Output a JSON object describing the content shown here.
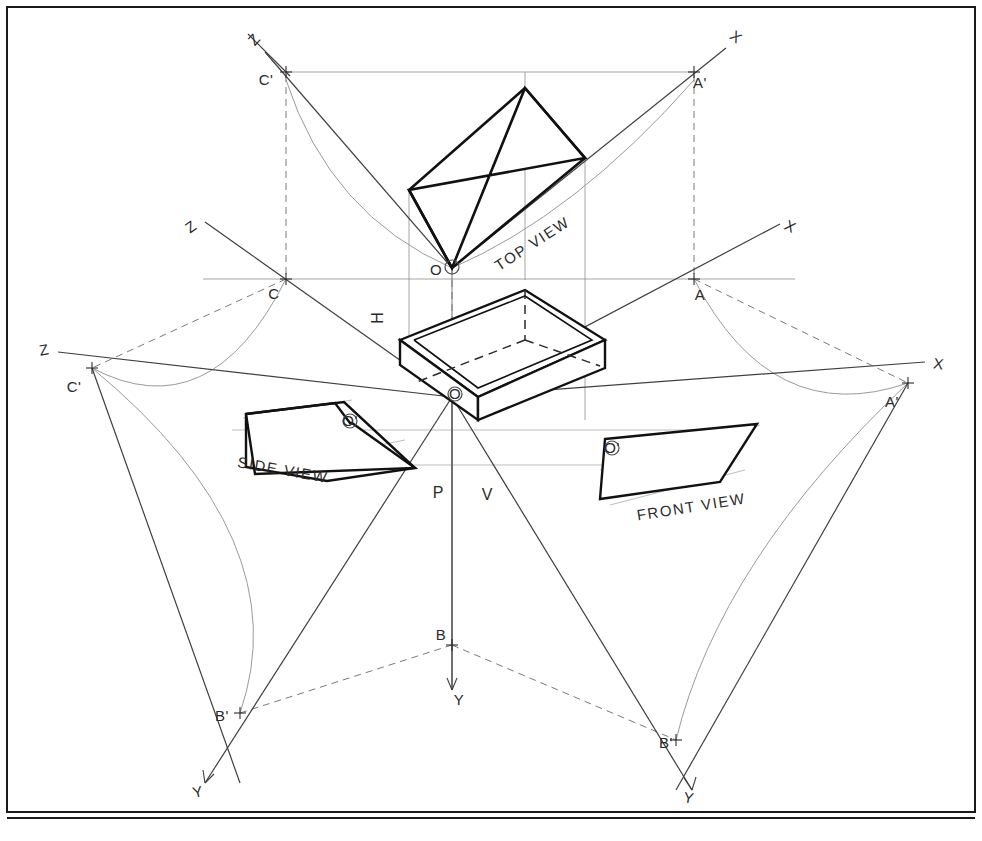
{
  "sheet": {
    "width": 982,
    "height": 841,
    "background_color": "#ffffff",
    "border_color": "#1a1a1a",
    "title": "Orthographic Projection Planes Development"
  },
  "colors": {
    "heavy_line": "#111111",
    "thin_line": "#4a4a4a",
    "light_line": "#8d8d8d",
    "construction_line": "#9a9a9a",
    "hidden_line": "#5a5a5a",
    "arc_line": "#9a9a9a",
    "text": "#2b2b2b"
  },
  "views": {
    "top": {
      "label": "TOP VIEW"
    },
    "front": {
      "label": "FRONT VIEW"
    },
    "side": {
      "label": "SIDE VIEW"
    }
  },
  "planes": [
    {
      "id": "h-plane",
      "label": "H"
    },
    {
      "id": "p-plane",
      "label": "P"
    },
    {
      "id": "v-plane",
      "label": "V"
    }
  ],
  "axis_labels": [
    {
      "id": "axis-z-top-left",
      "label": "Z",
      "x": 258,
      "y": 43
    },
    {
      "id": "axis-x-top-right",
      "label": "X",
      "x": 733,
      "y": 41
    },
    {
      "id": "axis-z-mid-left",
      "label": "Z",
      "x": 194,
      "y": 231
    },
    {
      "id": "axis-x-mid-right",
      "label": "X",
      "x": 785,
      "y": 231
    },
    {
      "id": "axis-z-far-left",
      "label": "Z",
      "x": 45,
      "y": 355
    },
    {
      "id": "axis-x-far-right",
      "label": "X",
      "x": 935,
      "y": 369
    },
    {
      "id": "axis-y-bottom-left",
      "label": "Y",
      "x": 200,
      "y": 795
    },
    {
      "id": "axis-y-bottom-mid",
      "label": "Y",
      "x": 459,
      "y": 703
    },
    {
      "id": "axis-y-bottom-right",
      "label": "Y",
      "x": 687,
      "y": 801
    }
  ],
  "point_labels": [
    {
      "id": "point-c-prime-top",
      "label": "C'",
      "x": 266,
      "y": 85
    },
    {
      "id": "point-a-prime-top",
      "label": "A'",
      "x": 694,
      "y": 86
    },
    {
      "id": "point-o-top",
      "label": "O",
      "x": 452,
      "y": 273
    },
    {
      "id": "point-c-mid",
      "label": "C",
      "x": 278,
      "y": 299
    },
    {
      "id": "point-a-mid",
      "label": "A",
      "x": 695,
      "y": 299
    },
    {
      "id": "point-c-prime-left",
      "label": "C'",
      "x": 74,
      "y": 392
    },
    {
      "id": "point-a-prime-right",
      "label": "A'",
      "x": 888,
      "y": 405
    },
    {
      "id": "point-o-center",
      "label": "O",
      "x": 447,
      "y": 397
    },
    {
      "id": "point-o-prime-side",
      "label": "O'",
      "x": 344,
      "y": 422
    },
    {
      "id": "point-o-prime-front",
      "label": "O'",
      "x": 607,
      "y": 451
    },
    {
      "id": "point-b-mid",
      "label": "B",
      "x": 442,
      "y": 637
    },
    {
      "id": "point-b-prime-left",
      "label": "B'",
      "x": 222,
      "y": 722
    },
    {
      "id": "point-b-prime-right",
      "label": "B'",
      "x": 664,
      "y": 748
    }
  ],
  "annotations": {
    "h_plane_label": "H",
    "p_plane_label": "P",
    "v_plane_label": "V"
  }
}
